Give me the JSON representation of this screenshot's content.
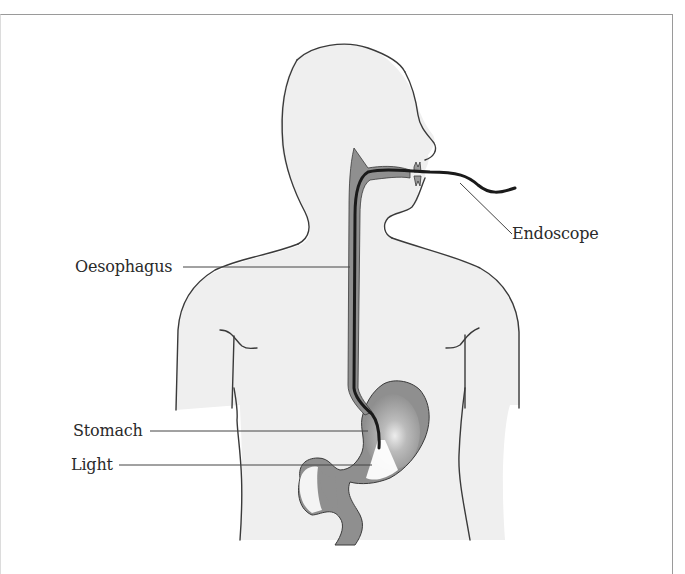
{
  "diagram": {
    "colors": {
      "skin_fill": "#efefef",
      "outline": "#3a3a3a",
      "organ_fill": "#8f8f8f",
      "organ_highlight": "#e6e6e6",
      "endoscope": "#1a1a1a",
      "leader_line": "#444444",
      "frame_border": "#9a9a9a"
    },
    "labels": [
      {
        "id": "endoscope",
        "text": "Endoscope"
      },
      {
        "id": "oesophagus",
        "text": "Oesophagus"
      },
      {
        "id": "stomach",
        "text": "Stomach"
      },
      {
        "id": "light",
        "text": "Light"
      }
    ]
  }
}
